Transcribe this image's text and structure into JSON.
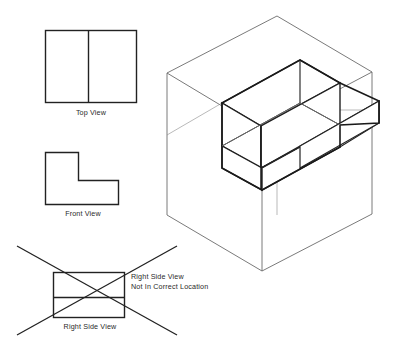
{
  "document": {
    "title": "Orthographic Projection Study - Glass Box with L-Block",
    "background_color": "#ffffff",
    "line_color": "#222222",
    "glassbox_line_color": "#6b6b6b"
  },
  "views": {
    "top": {
      "label": "Top View",
      "shape": "rectangle-with-vertical-divider",
      "x": 45,
      "y": 30,
      "width": 92,
      "height": 73,
      "divider_x": 88
    },
    "front": {
      "label": "Front View",
      "shape": "L-shape",
      "x": 45,
      "y": 152,
      "width": 73,
      "height": 53,
      "notch_corner_x": 78,
      "notch_corner_y": 180
    },
    "right_side": {
      "label": "Right Side View",
      "shape": "rectangle-with-horizontal-divider",
      "x": 53,
      "y": 272,
      "width": 72,
      "height": 46,
      "divider_y": 298,
      "crossed_out": true,
      "annotation_line_1": "Right Side View",
      "annotation_line_2": "Not In Correct Location"
    }
  },
  "isometric": {
    "label": "isometric-glass-box-with-L-block",
    "glass_box": {
      "top_corner": [
        277,
        16
      ],
      "left_corner": [
        167,
        73
      ],
      "right_corner": [
        372,
        72
      ],
      "front_corner": [
        262,
        130
      ],
      "bottom_left": [
        167,
        215
      ],
      "bottom_front": [
        262,
        271
      ],
      "bottom_right": [
        372,
        214
      ]
    },
    "object": {
      "description": "L-shaped block, tall portion at rear-left, low step extending to front-right",
      "top_rear": [
        300,
        60
      ],
      "top_left": [
        222,
        103
      ],
      "top_right": [
        379,
        101
      ]
    }
  },
  "strikethrough": {
    "name": "x-cross-over-right-side-view",
    "line_a": [
      17,
      246,
      177,
      335
    ],
    "line_b": [
      17,
      335,
      177,
      246
    ]
  }
}
